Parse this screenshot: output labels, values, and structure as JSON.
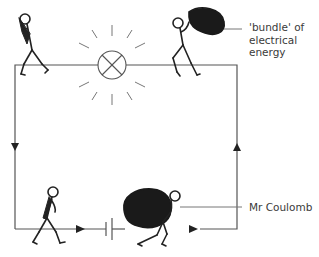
{
  "diagram": {
    "type": "electric-circuit-analogy",
    "labels": {
      "bundle_line1": "'bundle' of",
      "bundle_line2": "electrical",
      "bundle_line3": "energy",
      "coulomb": "Mr Coulomb"
    },
    "components": [
      "lamp",
      "cell",
      "wire-loop"
    ],
    "figures": [
      {
        "id": "figure-top-left",
        "carrying": "empty/deflated bag",
        "position": "top-left, after lamp"
      },
      {
        "id": "figure-top-right",
        "carrying": "bundle of electrical energy",
        "position": "top-right, before lamp"
      },
      {
        "id": "figure-bottom-left",
        "carrying": "nothing",
        "position": "bottom-left, approaching cell"
      },
      {
        "id": "figure-bottom-right",
        "carrying": "bundle of electrical energy (Mr Coulomb)",
        "position": "bottom, after cell"
      }
    ],
    "arrows": [
      {
        "side": "left",
        "direction": "down"
      },
      {
        "side": "bottom-left",
        "direction": "right"
      },
      {
        "side": "bottom-right",
        "direction": "right"
      },
      {
        "side": "right",
        "direction": "up"
      }
    ],
    "colors": {
      "wire": "#555555",
      "figure": "#222222",
      "bundle": "#1a1a1a",
      "text": "#3a3a3a"
    }
  }
}
